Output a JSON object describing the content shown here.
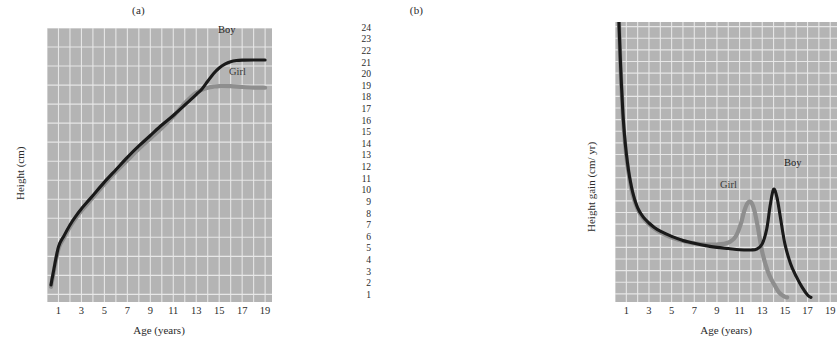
{
  "figure": {
    "panels": [
      {
        "id": "a",
        "title": "(a)",
        "axis": {
          "xlabel": "Age (years)",
          "ylabel": "Height (cm)",
          "xticks": [
            "1",
            "3",
            "5",
            "7",
            "9",
            "11",
            "13",
            "15",
            "17",
            "19"
          ],
          "yticks": [
            "190",
            "180",
            "170",
            "160",
            "150",
            "140",
            "130",
            "120",
            "110",
            "100",
            "90",
            "80",
            "70",
            "60",
            "50"
          ]
        },
        "labels": {
          "boy": "Boy",
          "girl": "Girl"
        }
      },
      {
        "id": "b",
        "title": "(b)",
        "axis": {
          "xlabel": "Age (years)",
          "ylabel": "Height gain (cm/ yr)",
          "xticks": [
            "1",
            "3",
            "5",
            "7",
            "9",
            "11",
            "13",
            "15",
            "17",
            "19"
          ],
          "yticks": [
            "24",
            "23",
            "22",
            "21",
            "20",
            "19",
            "18",
            "17",
            "16",
            "15",
            "14",
            "13",
            "12",
            "11",
            "10",
            "9",
            "8",
            "7",
            "6",
            "5",
            "4",
            "3",
            "2",
            "1"
          ]
        },
        "labels": {
          "boy": "Boy",
          "girl": "Girl"
        }
      }
    ]
  },
  "colors": {
    "plot_background": "#b4b4b4",
    "gridline": "#eaeaea",
    "boy_curve": "#1a1a1a",
    "girl_curve": "#8e8e8e",
    "page_background": "#ffffff",
    "text": "#2b2b2b"
  },
  "chart_data": [
    {
      "type": "line",
      "panel": "a",
      "title": "(a)",
      "xlabel": "Age (years)",
      "ylabel": "Height (cm)",
      "xlim": [
        0,
        19.6
      ],
      "ylim": [
        46,
        190
      ],
      "xtick_values": [
        1,
        3,
        5,
        7,
        9,
        11,
        13,
        15,
        17,
        19
      ],
      "ytick_values": [
        50,
        60,
        70,
        80,
        90,
        100,
        110,
        120,
        130,
        140,
        150,
        160,
        170,
        180,
        190
      ],
      "grid": true,
      "grid_x_step": 1,
      "grid_y_step": 10,
      "legend": "inline-annotation",
      "series": [
        {
          "name": "Boy",
          "color": "#1a1a1a",
          "x": [
            0.35,
            0.5,
            1,
            1.5,
            2,
            2.5,
            3,
            3.5,
            4,
            5,
            6,
            7,
            8,
            9,
            10,
            11,
            12,
            13,
            13.5,
            14,
            14.5,
            15,
            15.5,
            16,
            16.5,
            17,
            18,
            19
          ],
          "y": [
            55,
            60,
            75,
            81,
            86.5,
            91,
            95,
            98.5,
            102,
            109,
            115.5,
            122,
            128,
            133.5,
            139,
            144,
            149.5,
            155,
            158,
            162,
            166,
            169,
            171,
            172.3,
            172.9,
            173.1,
            173.2,
            173.2
          ]
        },
        {
          "name": "Girl",
          "color": "#8e8e8e",
          "x": [
            0.35,
            0.5,
            1,
            1.5,
            2,
            2.5,
            3,
            3.5,
            4,
            5,
            6,
            7,
            8,
            9,
            10,
            11,
            11.5,
            12,
            12.5,
            13,
            13.5,
            14,
            14.5,
            15,
            16,
            17,
            18,
            19
          ],
          "y": [
            54,
            59,
            74,
            80,
            85.5,
            90,
            94,
            97.5,
            101,
            108,
            114.5,
            120.5,
            126.5,
            132,
            137.5,
            143.5,
            147,
            150.5,
            153.5,
            156,
            157.5,
            158.6,
            159.2,
            159.5,
            159.4,
            159,
            158.7,
            158.6
          ]
        }
      ]
    },
    {
      "type": "line",
      "panel": "b",
      "title": "(b)",
      "xlabel": "Age (years)",
      "ylabel": "Height gain (cm/ yr)",
      "xlim": [
        0,
        19.6
      ],
      "ylim": [
        0.3,
        24.4
      ],
      "xtick_values": [
        1,
        3,
        5,
        7,
        9,
        11,
        13,
        15,
        17,
        19
      ],
      "ytick_values": [
        1,
        2,
        3,
        4,
        5,
        6,
        7,
        8,
        9,
        10,
        11,
        12,
        13,
        14,
        15,
        16,
        17,
        18,
        19,
        20,
        21,
        22,
        23,
        24
      ],
      "grid": true,
      "grid_x_step": 1,
      "grid_y_step": 1,
      "legend": "inline-annotation",
      "series": [
        {
          "name": "Boy",
          "color": "#1a1a1a",
          "x": [
            0.35,
            0.5,
            0.7,
            0.9,
            1.1,
            1.3,
            1.6,
            2,
            2.5,
            3,
            3.5,
            4,
            5,
            6,
            7,
            8,
            9,
            10,
            11,
            12,
            12.5,
            13,
            13.4,
            13.7,
            14,
            14.3,
            14.6,
            15,
            15.5,
            16,
            16.5,
            17,
            17.3
          ],
          "y": [
            24.4,
            20.5,
            16.5,
            14,
            12.3,
            11,
            9.6,
            8.4,
            7.6,
            7.1,
            6.7,
            6.4,
            5.95,
            5.6,
            5.35,
            5.15,
            5.0,
            4.9,
            4.8,
            4.78,
            4.85,
            5.3,
            6.6,
            8.6,
            10.0,
            9.3,
            7.6,
            5.3,
            3.6,
            2.5,
            1.6,
            0.9,
            0.7
          ]
        },
        {
          "name": "Girl",
          "color": "#8e8e8e",
          "x": [
            0.35,
            0.5,
            0.7,
            0.9,
            1.1,
            1.3,
            1.6,
            2,
            2.5,
            3,
            3.5,
            4,
            5,
            6,
            7,
            8,
            9,
            9.6,
            10.2,
            10.7,
            11.1,
            11.4,
            11.7,
            12,
            12.3,
            12.6,
            13,
            13.5,
            14,
            14.5,
            15,
            15.2
          ],
          "y": [
            24.4,
            20.3,
            16.3,
            13.8,
            12.1,
            10.8,
            9.4,
            8.3,
            7.5,
            7.0,
            6.6,
            6.3,
            5.85,
            5.55,
            5.35,
            5.25,
            5.25,
            5.3,
            5.5,
            6.0,
            7.0,
            8.1,
            8.8,
            8.9,
            8.2,
            6.8,
            4.6,
            2.9,
            1.9,
            1.1,
            0.75,
            0.7
          ]
        }
      ]
    }
  ]
}
